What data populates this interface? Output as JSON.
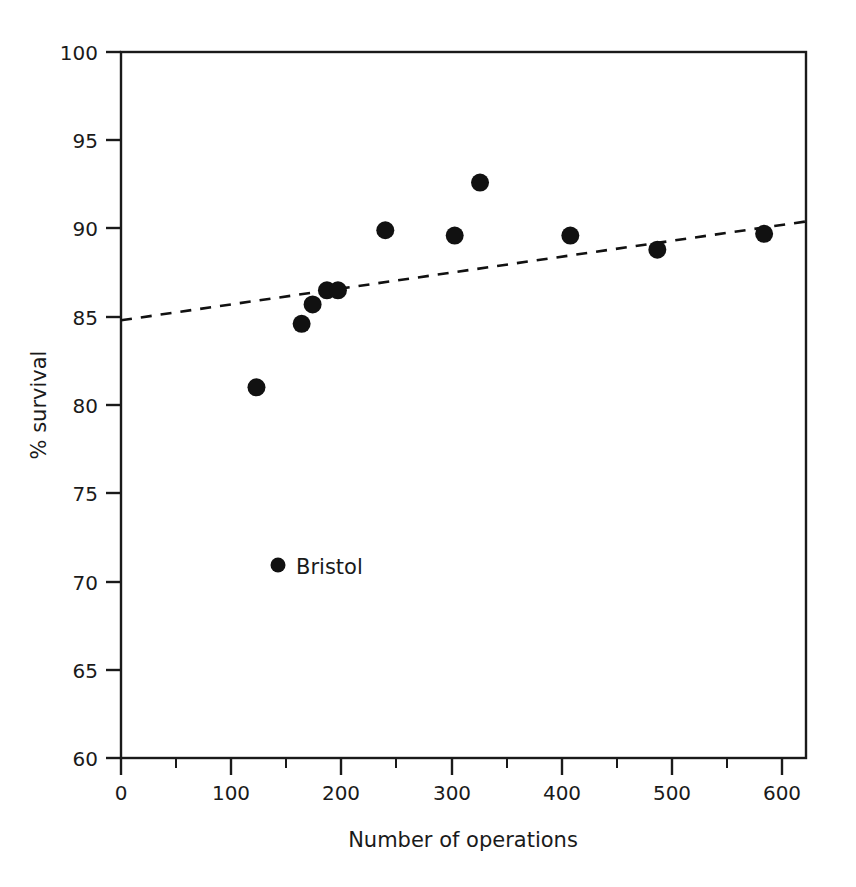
{
  "chart_data": {
    "type": "scatter",
    "title": "",
    "subtitle": "",
    "xlabel": "Number of operations",
    "ylabel": "% survival",
    "xlim": [
      0,
      622
    ],
    "ylim": [
      60,
      100
    ],
    "grid": false,
    "legend_position": "inside-lower-left",
    "x_ticks": [
      0,
      100,
      200,
      300,
      400,
      500,
      600
    ],
    "x_tick_labels": [
      "0",
      "100",
      "200",
      "300",
      "400",
      "500",
      "600"
    ],
    "x_minor_ticks": [
      50,
      150,
      250,
      350,
      450,
      550
    ],
    "y_ticks": [
      60,
      65,
      70,
      75,
      80,
      85,
      90,
      95,
      100
    ],
    "y_tick_labels": [
      "60",
      "65",
      "70",
      "75",
      "80",
      "85",
      "90",
      "95",
      "100"
    ],
    "points": [
      {
        "x": 123,
        "y": 81.0,
        "label": "Bristol"
      },
      {
        "x": 164,
        "y": 84.6,
        "label": ""
      },
      {
        "x": 174,
        "y": 85.7,
        "label": ""
      },
      {
        "x": 187,
        "y": 86.5,
        "label": ""
      },
      {
        "x": 197,
        "y": 86.5,
        "label": ""
      },
      {
        "x": 240,
        "y": 89.9,
        "label": ""
      },
      {
        "x": 303,
        "y": 89.6,
        "label": ""
      },
      {
        "x": 326,
        "y": 92.6,
        "label": ""
      },
      {
        "x": 408,
        "y": 89.6,
        "label": ""
      },
      {
        "x": 487,
        "y": 88.8,
        "label": ""
      },
      {
        "x": 584,
        "y": 89.7,
        "label": ""
      }
    ],
    "marker": {
      "shape": "circle",
      "size": 9,
      "color": "#111111"
    },
    "trendline": {
      "style": "dashed",
      "color": "#111111",
      "x_start": 0,
      "y_start": 84.8,
      "x_end": 622,
      "y_end": 90.4
    },
    "annotations": [
      {
        "name": "bristol-legend",
        "text": "Bristol",
        "marker": true
      }
    ]
  },
  "legend": {
    "bristol_label": "Bristol"
  },
  "axes": {
    "x_title": "Number of operations",
    "y_title": "% survival"
  }
}
